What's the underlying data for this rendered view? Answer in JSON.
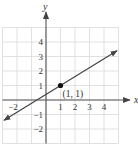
{
  "chart_data": {
    "type": "line",
    "title": "",
    "xlabel": "x",
    "ylabel": "y",
    "xlim": [
      -3,
      5
    ],
    "ylim": [
      -3,
      5
    ],
    "grid": true,
    "x_ticks": [
      {
        "value": -2,
        "label": "−2"
      },
      {
        "value": 1,
        "label": "1"
      },
      {
        "value": 2,
        "label": "2"
      },
      {
        "value": 3,
        "label": "3"
      },
      {
        "value": 4,
        "label": "4"
      }
    ],
    "y_ticks": [
      {
        "value": 4,
        "label": "4"
      },
      {
        "value": 3,
        "label": "3"
      },
      {
        "value": 2,
        "label": "2"
      },
      {
        "value": 1,
        "label": "1"
      },
      {
        "value": -1,
        "label": "−1"
      },
      {
        "value": -2,
        "label": "−2"
      }
    ],
    "series": [
      {
        "name": "line",
        "x": [
          -2.9,
          4.9
        ],
        "y": [
          -1.4,
          3.4
        ],
        "arrows_both_ends": true
      }
    ],
    "points": [
      {
        "x": 1,
        "y": 1,
        "label": "(1, 1)"
      }
    ]
  },
  "colors": {
    "grid": "#d9d9d9",
    "axis": "#555555",
    "line": "#444444",
    "point": "#111111"
  }
}
